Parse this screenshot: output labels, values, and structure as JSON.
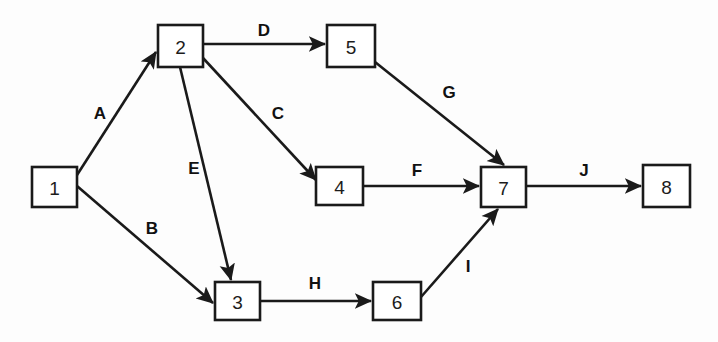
{
  "diagram": {
    "type": "directed-network-graph",
    "title": "",
    "background_color": "#fdfdfd",
    "line_color": "#1a1a1a",
    "nodes": [
      {
        "id": "1",
        "label": "1",
        "x": 32,
        "y": 167,
        "w": 45,
        "h": 40
      },
      {
        "id": "2",
        "label": "2",
        "x": 158,
        "y": 25,
        "w": 45,
        "h": 42
      },
      {
        "id": "3",
        "label": "3",
        "x": 215,
        "y": 282,
        "w": 45,
        "h": 38
      },
      {
        "id": "4",
        "label": "4",
        "x": 316,
        "y": 167,
        "w": 47,
        "h": 38
      },
      {
        "id": "5",
        "label": "5",
        "x": 327,
        "y": 25,
        "w": 48,
        "h": 42
      },
      {
        "id": "6",
        "label": "6",
        "x": 373,
        "y": 282,
        "w": 48,
        "h": 38
      },
      {
        "id": "7",
        "label": "7",
        "x": 481,
        "y": 167,
        "w": 45,
        "h": 40
      },
      {
        "id": "8",
        "label": "8",
        "x": 643,
        "y": 165,
        "w": 47,
        "h": 42
      }
    ],
    "edges": [
      {
        "id": "A",
        "label": "A",
        "from": "1",
        "to": "2",
        "x1": 77,
        "y1": 175,
        "x2": 156,
        "y2": 52,
        "lx": 100,
        "ly": 113
      },
      {
        "id": "B",
        "label": "B",
        "from": "1",
        "to": "3",
        "x1": 77,
        "y1": 186,
        "x2": 213,
        "y2": 303,
        "lx": 152,
        "ly": 228
      },
      {
        "id": "C",
        "label": "C",
        "from": "2",
        "to": "4",
        "x1": 203,
        "y1": 58,
        "x2": 316,
        "y2": 180,
        "lx": 278,
        "ly": 113
      },
      {
        "id": "D",
        "label": "D",
        "from": "2",
        "to": "5",
        "x1": 203,
        "y1": 44,
        "x2": 325,
        "y2": 44,
        "lx": 264,
        "ly": 30
      },
      {
        "id": "E",
        "label": "E",
        "from": "2",
        "to": "3",
        "x1": 180,
        "y1": 67,
        "x2": 231,
        "y2": 280,
        "lx": 194,
        "ly": 168
      },
      {
        "id": "F",
        "label": "F",
        "from": "4",
        "to": "7",
        "x1": 363,
        "y1": 186,
        "x2": 479,
        "y2": 186,
        "lx": 417,
        "ly": 170
      },
      {
        "id": "G",
        "label": "G",
        "from": "5",
        "to": "7",
        "x1": 375,
        "y1": 62,
        "x2": 504,
        "y2": 165,
        "lx": 449,
        "ly": 92
      },
      {
        "id": "H",
        "label": "H",
        "from": "3",
        "to": "6",
        "x1": 260,
        "y1": 301,
        "x2": 371,
        "y2": 301,
        "lx": 315,
        "ly": 283
      },
      {
        "id": "I",
        "label": "I",
        "from": "6",
        "to": "7",
        "x1": 421,
        "y1": 297,
        "x2": 498,
        "y2": 209,
        "lx": 468,
        "ly": 266
      },
      {
        "id": "J",
        "label": "J",
        "from": "7",
        "to": "8",
        "x1": 526,
        "y1": 186,
        "x2": 641,
        "y2": 186,
        "lx": 584,
        "ly": 170
      }
    ]
  }
}
